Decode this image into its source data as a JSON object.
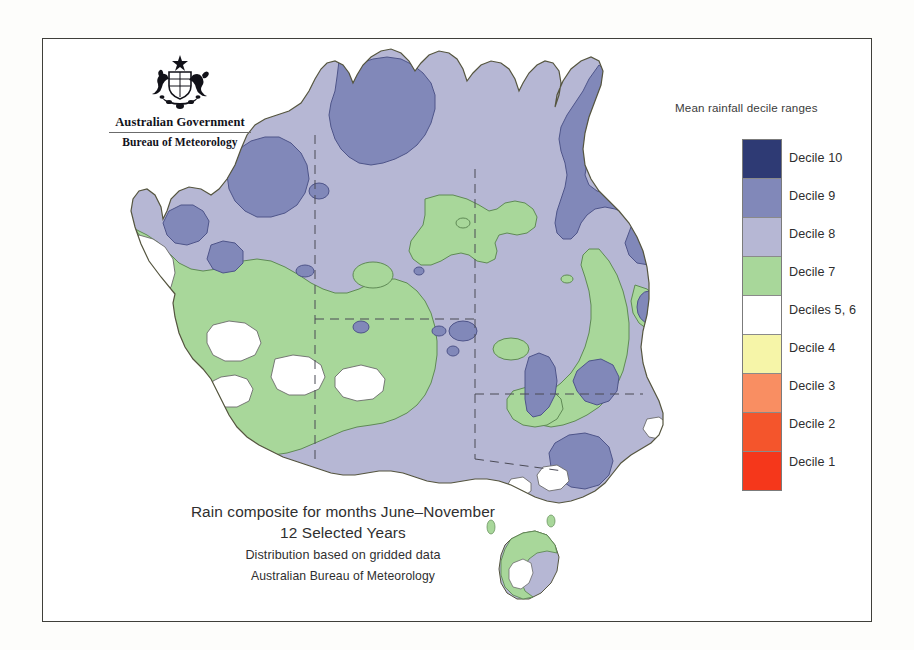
{
  "branding": {
    "crest_icon": "australian-coat-of-arms-icon",
    "government_line": "Australian Government",
    "agency_line": "Bureau of Meteorology"
  },
  "legend": {
    "title": "Mean rainfall decile ranges",
    "items": [
      {
        "label": "Decile 10",
        "color": "#2e3a74"
      },
      {
        "label": "Decile 9",
        "color": "#8188b9"
      },
      {
        "label": "Decile 8",
        "color": "#b6b7d4"
      },
      {
        "label": "Decile 7",
        "color": "#a8d79a"
      },
      {
        "label": "Deciles 5, 6",
        "color": "#ffffff"
      },
      {
        "label": "Decile 4",
        "color": "#f6f5a8"
      },
      {
        "label": "Decile 3",
        "color": "#f98e62"
      },
      {
        "label": "Decile 2",
        "color": "#f4552c"
      },
      {
        "label": "Decile 1",
        "color": "#f5371b"
      }
    ]
  },
  "caption": {
    "line1": "Rain composite for months June–November",
    "line2": "12 Selected Years",
    "line3": "Distribution based on gridded data",
    "line4": "Australian Bureau of Meteorology"
  },
  "chart_data": {
    "type": "map",
    "subtitle": "Distribution based on gridded data",
    "source": "Australian Bureau of Meteorology",
    "region": "Australia",
    "variable": "Mean rainfall decile range",
    "classes": [
      {
        "label": "Decile 10",
        "color": "#2e3a74"
      },
      {
        "label": "Decile 9",
        "color": "#8188b9"
      },
      {
        "label": "Decile 8",
        "color": "#b6b7d4"
      },
      {
        "label": "Decile 7",
        "color": "#a8d79a"
      },
      {
        "label": "Deciles 5, 6",
        "color": "#ffffff"
      },
      {
        "label": "Decile 4",
        "color": "#f6f5a8"
      },
      {
        "label": "Decile 3",
        "color": "#f98e62"
      },
      {
        "label": "Decile 2",
        "color": "#f4552c"
      },
      {
        "label": "Decile 1",
        "color": "#f5371b"
      }
    ],
    "classes_present_on_map": [
      "Decile 10",
      "Decile 9",
      "Decile 8",
      "Decile 7",
      "Deciles 5, 6"
    ],
    "regional_readings": [
      {
        "region": "Top End / Arnhem Land (NT north)",
        "decile": "Decile 9"
      },
      {
        "region": "Kimberley (WA north)",
        "decile": "Decile 9"
      },
      {
        "region": "Cape York Peninsula east coast (QLD)",
        "decile": "Decile 9"
      },
      {
        "region": "Central Australia interior",
        "decile": "Decile 8"
      },
      {
        "region": "Western Queensland",
        "decile": "Decile 8"
      },
      {
        "region": "Southwest Western Australia",
        "decile": "Decile 7"
      },
      {
        "region": "Nullarbor / Great Australian Bight coast",
        "decile": "Decile 7"
      },
      {
        "region": "Southeast NSW / Victoria uplands",
        "decile": "Decile 7"
      },
      {
        "region": "Central NSW inland patch",
        "decile": "Decile 9"
      },
      {
        "region": "Tasmania coastal fringe",
        "decile": "Decile 7"
      },
      {
        "region": "Tasmania interior",
        "decile": "Decile 8"
      },
      {
        "region": "Perth coastal strip",
        "decile": "Deciles 5, 6"
      },
      {
        "region": "Wheatbelt pockets (WA southwest)",
        "decile": "Deciles 5, 6"
      }
    ],
    "legend_position": "right",
    "grid": false,
    "boundaries": "state borders shown as dashed lines"
  }
}
